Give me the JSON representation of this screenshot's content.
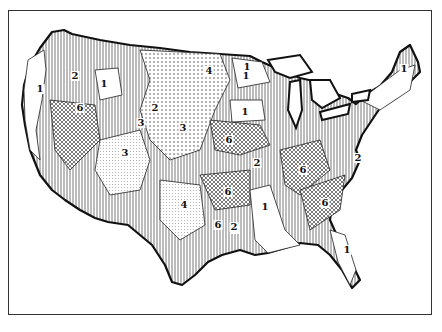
{
  "map": {
    "subject": "United States (contiguous) regions map",
    "style": "black-and-white hatched / stippled region map with numbered zones",
    "colors": {
      "ink": "#111111",
      "background": "#ffffff",
      "frame": "#333333"
    },
    "labels": [
      {
        "id": "l1",
        "text": "1",
        "x": 40,
        "y": 89
      },
      {
        "id": "l2",
        "text": "2",
        "x": 75,
        "y": 76
      },
      {
        "id": "l3",
        "text": "1",
        "x": 104,
        "y": 84
      },
      {
        "id": "l4",
        "text": "6",
        "x": 80,
        "y": 108
      },
      {
        "id": "l5",
        "text": "2",
        "x": 155,
        "y": 108
      },
      {
        "id": "l6",
        "text": "3",
        "x": 141,
        "y": 123
      },
      {
        "id": "l7",
        "text": "3",
        "x": 183,
        "y": 128
      },
      {
        "id": "l8",
        "text": "3",
        "x": 125,
        "y": 153
      },
      {
        "id": "l9",
        "text": "4",
        "x": 209,
        "y": 71
      },
      {
        "id": "l10",
        "text": "1",
        "x": 247,
        "y": 67
      },
      {
        "id": "l11",
        "text": "1",
        "x": 245,
        "y": 112
      },
      {
        "id": "l12",
        "text": "6",
        "x": 229,
        "y": 140
      },
      {
        "id": "l13",
        "text": "2",
        "x": 257,
        "y": 163
      },
      {
        "id": "l14",
        "text": "6",
        "x": 228,
        "y": 192
      },
      {
        "id": "l15",
        "text": "4",
        "x": 184,
        "y": 205
      },
      {
        "id": "l16",
        "text": "6",
        "x": 218,
        "y": 225
      },
      {
        "id": "l17",
        "text": "2",
        "x": 235,
        "y": 229
      },
      {
        "id": "l18",
        "text": "1",
        "x": 265,
        "y": 207
      },
      {
        "id": "l19",
        "text": "2",
        "x": 234,
        "y": 227
      },
      {
        "id": "l20",
        "text": "6",
        "x": 303,
        "y": 170
      },
      {
        "id": "l21",
        "text": "2",
        "x": 358,
        "y": 158
      },
      {
        "id": "l22",
        "text": "6",
        "x": 325,
        "y": 203
      },
      {
        "id": "l23",
        "text": "1",
        "x": 347,
        "y": 250
      },
      {
        "id": "l24",
        "text": "1",
        "x": 404,
        "y": 69
      },
      {
        "id": "l25",
        "text": "1",
        "x": 246,
        "y": 76
      }
    ]
  }
}
